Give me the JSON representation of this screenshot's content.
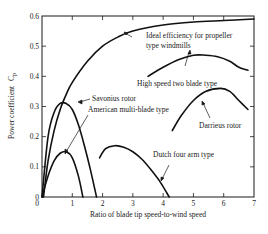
{
  "chart_data": {
    "type": "line",
    "title": "",
    "xlabel": "Ratio of blade tip speed-to-wind speed",
    "ylabel": "Power coefficient C_p",
    "ylabel_main": "Power coefficient",
    "ylabel_symbol": "C",
    "ylabel_subscript": "p",
    "xlim": [
      0,
      7
    ],
    "ylim": [
      0,
      0.6
    ],
    "xticks": [
      "0",
      "1",
      "2",
      "3",
      "4",
      "5",
      "6",
      "7"
    ],
    "yticks": [
      "0",
      "0.1",
      "0.2",
      "0.3",
      "0.4",
      "0.5",
      "0.6"
    ],
    "grid": false,
    "legend": "none (inline annotations)",
    "series": [
      {
        "name": "Ideal efficiency for propeller type windmills",
        "label_lines": [
          "Ideal efficiency for propeller",
          "type windmills"
        ],
        "x": [
          0.05,
          0.2,
          0.4,
          0.6,
          0.8,
          1.0,
          1.5,
          2.0,
          2.5,
          3.0,
          4.0,
          5.0,
          6.0,
          7.0
        ],
        "y": [
          0.0,
          0.12,
          0.22,
          0.29,
          0.34,
          0.38,
          0.45,
          0.5,
          0.53,
          0.55,
          0.57,
          0.58,
          0.585,
          0.59
        ]
      },
      {
        "name": "Savonius rotor",
        "x": [
          0.0,
          0.2,
          0.4,
          0.6,
          0.8,
          1.0,
          1.2,
          1.4,
          1.6,
          1.8
        ],
        "y": [
          0.0,
          0.2,
          0.28,
          0.31,
          0.31,
          0.29,
          0.24,
          0.17,
          0.09,
          0.0
        ]
      },
      {
        "name": "American multi-blade type",
        "x": [
          0.0,
          0.2,
          0.4,
          0.6,
          0.8,
          1.0,
          1.2,
          1.35
        ],
        "y": [
          0.0,
          0.07,
          0.12,
          0.145,
          0.15,
          0.13,
          0.07,
          0.0
        ]
      },
      {
        "name": "Dutch four arm type",
        "x": [
          1.9,
          2.1,
          2.4,
          2.7,
          3.0,
          3.3,
          3.6,
          3.9,
          4.2
        ],
        "y": [
          0.13,
          0.16,
          0.17,
          0.165,
          0.15,
          0.125,
          0.09,
          0.05,
          0.0
        ]
      },
      {
        "name": "High speed two blade type",
        "x": [
          3.5,
          4.0,
          4.5,
          5.0,
          5.4,
          5.8,
          6.2,
          6.5,
          6.8
        ],
        "y": [
          0.4,
          0.43,
          0.455,
          0.47,
          0.47,
          0.465,
          0.45,
          0.43,
          0.42
        ]
      },
      {
        "name": "Darrieus rotor",
        "x": [
          4.3,
          4.6,
          5.0,
          5.4,
          5.9,
          6.2,
          6.5,
          6.8
        ],
        "y": [
          0.22,
          0.27,
          0.32,
          0.35,
          0.36,
          0.35,
          0.32,
          0.29
        ]
      }
    ]
  }
}
